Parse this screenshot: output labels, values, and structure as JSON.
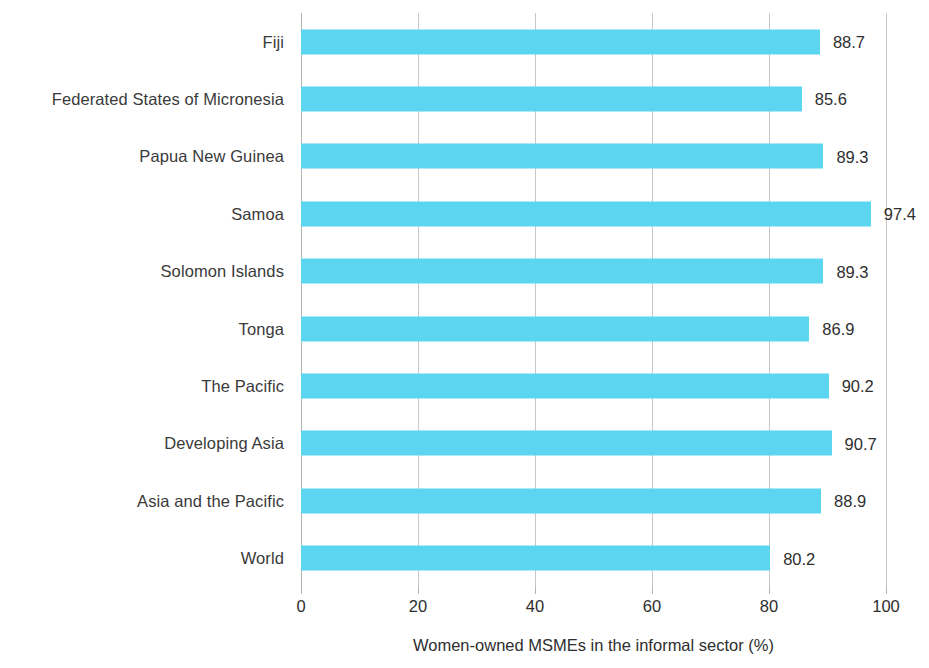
{
  "chart_data": {
    "type": "bar",
    "orientation": "horizontal",
    "title": "",
    "subtitle": "",
    "xlabel": "Women-owned MSMEs in the informal sector (%)",
    "ylabel": "",
    "xlim": [
      0,
      100
    ],
    "xticks": [
      0,
      20,
      40,
      60,
      80,
      100
    ],
    "xtick_labels": [
      "0",
      "20",
      "40",
      "60",
      "80",
      "100"
    ],
    "grid": true,
    "grid_axis": "x",
    "legend": false,
    "legend_position": "none",
    "bar_color": "#5bd5f0",
    "label_color": "#3a3a3a",
    "gridline_color": "#c8c8c8",
    "categories": [
      "Fiji",
      "Federated States of Micronesia",
      "Papua New Guinea",
      "Samoa",
      "Solomon Islands",
      "Tonga",
      "The Pacific",
      "Developing Asia",
      "Asia and the Pacific",
      "World"
    ],
    "values": [
      88.7,
      85.6,
      89.3,
      97.4,
      89.3,
      86.9,
      90.2,
      90.7,
      88.9,
      80.2
    ],
    "value_labels": [
      "88.7",
      "85.6",
      "89.3",
      "97.4",
      "89.3",
      "86.9",
      "90.2",
      "90.7",
      "88.9",
      "80.2"
    ]
  }
}
